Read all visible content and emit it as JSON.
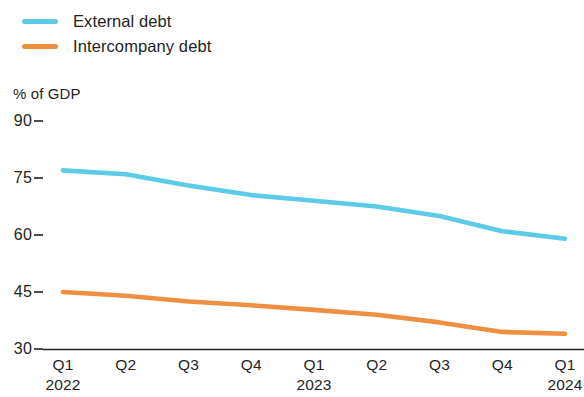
{
  "legend": {
    "position": "top-left",
    "items": [
      {
        "label": "External debt",
        "color": "#5bcbe8",
        "icon": "line-swatch-icon"
      },
      {
        "label": "Intercompany debt",
        "color": "#ee9040",
        "icon": "line-swatch-icon"
      }
    ]
  },
  "axes": {
    "y_unit_label": "% of GDP",
    "y_ticks": [
      "90",
      "75",
      "60",
      "45",
      "30"
    ],
    "x_ticks": [
      "Q1",
      "Q2",
      "Q3",
      "Q4",
      "Q1",
      "Q2",
      "Q3",
      "Q4",
      "Q1"
    ],
    "x_years": [
      {
        "label": "2022",
        "at_index": 0
      },
      {
        "label": "2023",
        "at_index": 4
      },
      {
        "label": "2024",
        "at_index": 8
      }
    ]
  },
  "chart_data": {
    "type": "line",
    "title": "",
    "subtitle": "",
    "xlabel": "",
    "ylabel": "% of GDP",
    "categories": [
      "Q1 2022",
      "Q2 2022",
      "Q3 2022",
      "Q4 2022",
      "Q1 2023",
      "Q2 2023",
      "Q3 2023",
      "Q4 2023",
      "Q1 2024"
    ],
    "series": [
      {
        "name": "External debt",
        "color": "#5bcbe8",
        "values": [
          77,
          76,
          73,
          70.5,
          69,
          67.5,
          65,
          61,
          59
        ]
      },
      {
        "name": "Intercompany debt",
        "color": "#ee9040",
        "values": [
          45,
          44,
          42.5,
          41.5,
          40.3,
          39,
          37,
          34.5,
          34
        ]
      }
    ],
    "ylim": [
      30,
      90
    ],
    "ytick_values": [
      90,
      75,
      60,
      45,
      30
    ],
    "grid": false,
    "legend_position": "top-left",
    "axis_line": "bottom-only",
    "annotations": []
  },
  "colors": {
    "external_debt": "#5bcbe8",
    "intercompany_debt": "#ee9040",
    "axis": "#231f20",
    "text": "#231f20",
    "background": "#ffffff"
  }
}
